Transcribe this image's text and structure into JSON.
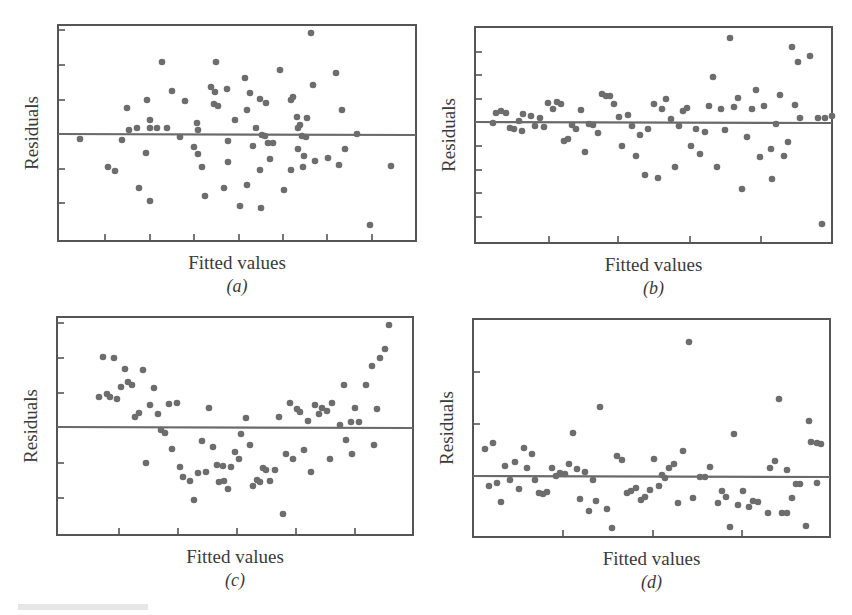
{
  "figure": {
    "caption_fragment": "",
    "colors": {
      "points": "#6d6d6d",
      "frame": "#555555",
      "zero_line": "#6a6a6a",
      "text": "#3a3a3a"
    }
  },
  "chart_data": [
    {
      "type": "scatter",
      "panel_label": "(a)",
      "title": "",
      "xlabel": "Fitted values",
      "ylabel": "Residuals",
      "grid": false,
      "reference_line": {
        "y": 0,
        "label": "zero residual line"
      },
      "box": {
        "left": 58,
        "top": 25,
        "right": 416,
        "bottom": 241
      },
      "zero_y_px": 134,
      "y_ticks_px": [
        30,
        65,
        100,
        169,
        203
      ],
      "x_ticks_px": [
        105,
        150,
        194,
        239,
        283,
        327,
        372
      ],
      "pattern": "random scatter around zero (constant variance)",
      "points_px": [
        [
          80,
          139
        ],
        [
          108,
          167
        ],
        [
          115,
          171
        ],
        [
          122,
          140
        ],
        [
          127,
          108
        ],
        [
          129,
          130
        ],
        [
          137,
          128
        ],
        [
          139,
          188
        ],
        [
          147,
          100
        ],
        [
          146,
          153
        ],
        [
          150,
          120
        ],
        [
          150,
          128
        ],
        [
          150,
          201
        ],
        [
          157,
          128
        ],
        [
          162,
          62
        ],
        [
          167,
          128
        ],
        [
          172,
          91
        ],
        [
          180,
          137
        ],
        [
          185,
          101
        ],
        [
          194,
          147
        ],
        [
          197,
          123
        ],
        [
          198,
          130
        ],
        [
          198,
          154
        ],
        [
          202,
          167
        ],
        [
          205,
          196
        ],
        [
          211,
          87
        ],
        [
          214,
          104
        ],
        [
          215,
          92
        ],
        [
          216,
          62
        ],
        [
          218,
          106
        ],
        [
          224,
          188
        ],
        [
          227,
          89
        ],
        [
          228,
          141
        ],
        [
          228,
          162
        ],
        [
          235,
          120
        ],
        [
          240,
          206
        ],
        [
          245,
          78
        ],
        [
          247,
          185
        ],
        [
          247,
          110
        ],
        [
          250,
          93
        ],
        [
          253,
          146
        ],
        [
          256,
          128
        ],
        [
          260,
          99
        ],
        [
          260,
          170
        ],
        [
          261,
          208
        ],
        [
          262,
          135
        ],
        [
          265,
          136
        ],
        [
          266,
          103
        ],
        [
          268,
          143
        ],
        [
          270,
          159
        ],
        [
          273,
          143
        ],
        [
          280,
          70
        ],
        [
          284,
          190
        ],
        [
          291,
          100
        ],
        [
          291,
          170
        ],
        [
          293,
          97
        ],
        [
          297,
          117
        ],
        [
          298,
          128
        ],
        [
          298,
          149
        ],
        [
          300,
          125
        ],
        [
          302,
          136
        ],
        [
          303,
          167
        ],
        [
          304,
          156
        ],
        [
          306,
          137
        ],
        [
          307,
          118
        ],
        [
          313,
          85
        ],
        [
          315,
          161
        ],
        [
          328,
          158
        ],
        [
          336,
          73
        ],
        [
          339,
          165
        ],
        [
          342,
          110
        ],
        [
          345,
          149
        ],
        [
          357,
          134
        ],
        [
          370,
          225
        ],
        [
          391,
          166
        ],
        [
          311,
          33
        ]
      ]
    },
    {
      "type": "scatter",
      "panel_label": "(b)",
      "title": "",
      "xlabel": "Fitted values",
      "ylabel": "Residuals",
      "grid": false,
      "reference_line": {
        "y": 0,
        "label": "zero residual line"
      },
      "box": {
        "left": 475,
        "top": 27,
        "right": 832,
        "bottom": 243
      },
      "zero_y_px": 122,
      "y_ticks_px": [
        52,
        75,
        99,
        146,
        170,
        193,
        217
      ],
      "x_ticks_px": [
        549,
        618,
        690,
        761
      ],
      "pattern": "funnel — variance increases with fitted values",
      "points_px": [
        [
          493,
          123
        ],
        [
          496,
          113
        ],
        [
          501,
          111
        ],
        [
          506,
          113
        ],
        [
          510,
          128
        ],
        [
          514,
          129
        ],
        [
          519,
          121
        ],
        [
          522,
          131
        ],
        [
          523,
          114
        ],
        [
          531,
          116
        ],
        [
          535,
          126
        ],
        [
          540,
          118
        ],
        [
          544,
          127
        ],
        [
          548,
          103
        ],
        [
          553,
          109
        ],
        [
          557,
          102
        ],
        [
          561,
          104
        ],
        [
          564,
          141
        ],
        [
          568,
          139
        ],
        [
          572,
          125
        ],
        [
          576,
          129
        ],
        [
          581,
          110
        ],
        [
          585,
          152
        ],
        [
          589,
          124
        ],
        [
          593,
          125
        ],
        [
          598,
          133
        ],
        [
          602,
          94
        ],
        [
          606,
          96
        ],
        [
          610,
          96
        ],
        [
          614,
          104
        ],
        [
          619,
          117
        ],
        [
          622,
          146
        ],
        [
          628,
          115
        ],
        [
          632,
          126
        ],
        [
          636,
          156
        ],
        [
          640,
          135
        ],
        [
          645,
          175
        ],
        [
          648,
          129
        ],
        [
          654,
          104
        ],
        [
          658,
          178
        ],
        [
          662,
          109
        ],
        [
          666,
          99
        ],
        [
          671,
          119
        ],
        [
          675,
          167
        ],
        [
          679,
          126
        ],
        [
          683,
          111
        ],
        [
          687,
          108
        ],
        [
          691,
          146
        ],
        [
          696,
          129
        ],
        [
          700,
          154
        ],
        [
          705,
          132
        ],
        [
          709,
          106
        ],
        [
          713,
          77
        ],
        [
          717,
          167
        ],
        [
          721,
          109
        ],
        [
          725,
          130
        ],
        [
          730,
          38
        ],
        [
          734,
          107
        ],
        [
          738,
          98
        ],
        [
          742,
          189
        ],
        [
          747,
          137
        ],
        [
          752,
          109
        ],
        [
          756,
          90
        ],
        [
          760,
          157
        ],
        [
          764,
          106
        ],
        [
          771,
          149
        ],
        [
          772,
          179
        ],
        [
          776,
          124
        ],
        [
          780,
          95
        ],
        [
          784,
          156
        ],
        [
          788,
          142
        ],
        [
          792,
          47
        ],
        [
          795,
          105
        ],
        [
          798,
          62
        ],
        [
          800,
          118
        ],
        [
          810,
          56
        ],
        [
          818,
          118
        ],
        [
          822,
          224
        ],
        [
          825,
          118
        ],
        [
          832,
          116
        ]
      ]
    },
    {
      "type": "scatter",
      "panel_label": "(c)",
      "title": "",
      "xlabel": "Fitted values",
      "ylabel": "Residuals",
      "grid": false,
      "reference_line": {
        "y": 0,
        "label": "zero residual line"
      },
      "box": {
        "left": 57,
        "top": 317,
        "right": 413,
        "bottom": 535
      },
      "zero_y_px": 427,
      "y_ticks_px": [
        323,
        358,
        393,
        463,
        498
      ],
      "x_ticks_px": [
        119,
        178,
        237,
        296,
        355
      ],
      "pattern": "U-shaped curvature (nonlinearity)",
      "points_px": [
        [
          99,
          397
        ],
        [
          103,
          357
        ],
        [
          107,
          394
        ],
        [
          110,
          397
        ],
        [
          114,
          358
        ],
        [
          117,
          399
        ],
        [
          121,
          387
        ],
        [
          125,
          369
        ],
        [
          128,
          382
        ],
        [
          132,
          385
        ],
        [
          135,
          417
        ],
        [
          139,
          413
        ],
        [
          143,
          370
        ],
        [
          146,
          463
        ],
        [
          150,
          405
        ],
        [
          154,
          388
        ],
        [
          158,
          414
        ],
        [
          161,
          430
        ],
        [
          165,
          433
        ],
        [
          172,
          449
        ],
        [
          169,
          404
        ],
        [
          177,
          403
        ],
        [
          180,
          467
        ],
        [
          183,
          477
        ],
        [
          190,
          481
        ],
        [
          194,
          500
        ],
        [
          198,
          473
        ],
        [
          202,
          441
        ],
        [
          206,
          472
        ],
        [
          209,
          408
        ],
        [
          213,
          447
        ],
        [
          217,
          465
        ],
        [
          219,
          482
        ],
        [
          223,
          466
        ],
        [
          224,
          481
        ],
        [
          228,
          489
        ],
        [
          231,
          467
        ],
        [
          235,
          452
        ],
        [
          239,
          459
        ],
        [
          241,
          434
        ],
        [
          246,
          418
        ],
        [
          250,
          445
        ],
        [
          253,
          486
        ],
        [
          257,
          480
        ],
        [
          260,
          482
        ],
        [
          263,
          468
        ],
        [
          266,
          470
        ],
        [
          270,
          481
        ],
        [
          275,
          470
        ],
        [
          279,
          417
        ],
        [
          283,
          514
        ],
        [
          286,
          454
        ],
        [
          290,
          403
        ],
        [
          293,
          459
        ],
        [
          297,
          409
        ],
        [
          300,
          412
        ],
        [
          304,
          450
        ],
        [
          308,
          421
        ],
        [
          311,
          472
        ],
        [
          315,
          405
        ],
        [
          319,
          414
        ],
        [
          322,
          408
        ],
        [
          327,
          411
        ],
        [
          330,
          459
        ],
        [
          332,
          403
        ],
        [
          340,
          425
        ],
        [
          344,
          385
        ],
        [
          346,
          440
        ],
        [
          351,
          422
        ],
        [
          352,
          454
        ],
        [
          355,
          408
        ],
        [
          359,
          422
        ],
        [
          366,
          385
        ],
        [
          372,
          366
        ],
        [
          377,
          409
        ],
        [
          374,
          445
        ],
        [
          380,
          358
        ],
        [
          385,
          349
        ],
        [
          389,
          325
        ]
      ]
    },
    {
      "type": "scatter",
      "panel_label": "(d)",
      "title": "",
      "xlabel": "Fitted values",
      "ylabel": "Residuals",
      "grid": false,
      "reference_line": {
        "y": 0,
        "label": "zero residual line"
      },
      "box": {
        "left": 473,
        "top": 319,
        "right": 830,
        "bottom": 537
      },
      "zero_y_px": 476,
      "y_ticks_px": [
        372,
        424
      ],
      "x_ticks_px": [
        563,
        653,
        742
      ],
      "pattern": "residuals with outliers / skewed positive",
      "points_px": [
        [
          485,
          449
        ],
        [
          489,
          486
        ],
        [
          493,
          443
        ],
        [
          497,
          483
        ],
        [
          501,
          502
        ],
        [
          505,
          466
        ],
        [
          510,
          480
        ],
        [
          515,
          462
        ],
        [
          519,
          489
        ],
        [
          524,
          448
        ],
        [
          527,
          468
        ],
        [
          532,
          454
        ],
        [
          535,
          480
        ],
        [
          539,
          493
        ],
        [
          543,
          494
        ],
        [
          547,
          492
        ],
        [
          552,
          468
        ],
        [
          556,
          476
        ],
        [
          560,
          473
        ],
        [
          565,
          474
        ],
        [
          569,
          464
        ],
        [
          573,
          433
        ],
        [
          577,
          469
        ],
        [
          580,
          499
        ],
        [
          585,
          472
        ],
        [
          589,
          511
        ],
        [
          593,
          480
        ],
        [
          596,
          501
        ],
        [
          600,
          407
        ],
        [
          607,
          509
        ],
        [
          612,
          528
        ],
        [
          617,
          456
        ],
        [
          622,
          460
        ],
        [
          627,
          493
        ],
        [
          631,
          491
        ],
        [
          636,
          488
        ],
        [
          641,
          500
        ],
        [
          645,
          497
        ],
        [
          650,
          490
        ],
        [
          654,
          459
        ],
        [
          659,
          486
        ],
        [
          662,
          475
        ],
        [
          665,
          478
        ],
        [
          669,
          468
        ],
        [
          674,
          464
        ],
        [
          678,
          503
        ],
        [
          683,
          451
        ],
        [
          689,
          342
        ],
        [
          693,
          498
        ],
        [
          700,
          477
        ],
        [
          705,
          477
        ],
        [
          710,
          467
        ],
        [
          718,
          503
        ],
        [
          722,
          491
        ],
        [
          726,
          497
        ],
        [
          730,
          527
        ],
        [
          734,
          434
        ],
        [
          738,
          505
        ],
        [
          743,
          491
        ],
        [
          749,
          507
        ],
        [
          753,
          501
        ],
        [
          758,
          502
        ],
        [
          768,
          513
        ],
        [
          770,
          468
        ],
        [
          775,
          461
        ],
        [
          779,
          399
        ],
        [
          782,
          513
        ],
        [
          787,
          470
        ],
        [
          792,
          498
        ],
        [
          796,
          484
        ],
        [
          800,
          484
        ],
        [
          806,
          526
        ],
        [
          809,
          421
        ],
        [
          811,
          442
        ],
        [
          817,
          443
        ],
        [
          821,
          444
        ],
        [
          817,
          483
        ],
        [
          787,
          513
        ]
      ]
    }
  ]
}
